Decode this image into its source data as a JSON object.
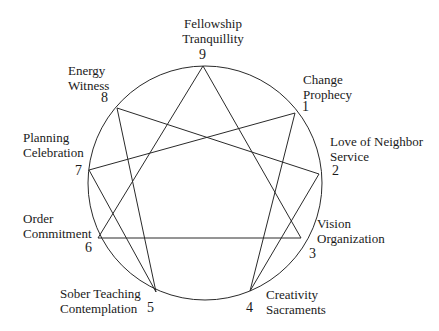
{
  "diagram": {
    "type": "enneagram",
    "circle": {
      "cx": 205,
      "cy": 183,
      "r": 117
    },
    "points": [
      {
        "num": "9",
        "line1": "Fellowship",
        "line2": "Tranquillity",
        "x": 203,
        "y": 66
      },
      {
        "num": "1",
        "line1": "Change",
        "line2": "Prophecy",
        "x": 295,
        "y": 113
      },
      {
        "num": "2",
        "line1": "Love of Neighbor",
        "line2": "Service",
        "x": 319,
        "y": 174
      },
      {
        "num": "3",
        "line1": "Vision",
        "line2": "Organization",
        "x": 301,
        "y": 238
      },
      {
        "num": "4",
        "line1": "Creativity",
        "line2": "Sacraments",
        "x": 250,
        "y": 291
      },
      {
        "num": "5",
        "line1": "Sober Teaching",
        "line2": "Contemplation",
        "x": 156,
        "y": 292
      },
      {
        "num": "6",
        "line1": "Order",
        "line2": "Commitment",
        "x": 98,
        "y": 238
      },
      {
        "num": "7",
        "line1": "Planning",
        "line2": "Celebration",
        "x": 89,
        "y": 170
      },
      {
        "num": "8",
        "line1": "Energy",
        "line2": "Witness",
        "x": 117,
        "y": 108
      }
    ],
    "connections": [
      [
        "1",
        "4"
      ],
      [
        "4",
        "2"
      ],
      [
        "2",
        "8"
      ],
      [
        "8",
        "5"
      ],
      [
        "5",
        "7"
      ],
      [
        "7",
        "1"
      ],
      [
        "9",
        "3"
      ],
      [
        "3",
        "6"
      ],
      [
        "6",
        "9"
      ]
    ],
    "line_color": "#2a2a2a"
  }
}
